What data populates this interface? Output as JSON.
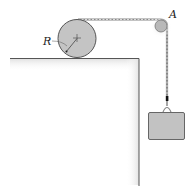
{
  "diagram": {
    "labels": {
      "radius": "R",
      "pulley": "A"
    },
    "colors": {
      "wheel_fill": "#c4c4c4",
      "pulley_fill": "#b8b8b8",
      "block_fill": "#c2c2c2",
      "outline": "#555555",
      "ground_shade": "#e6e6e6",
      "rope": "#8a8a8a"
    }
  }
}
